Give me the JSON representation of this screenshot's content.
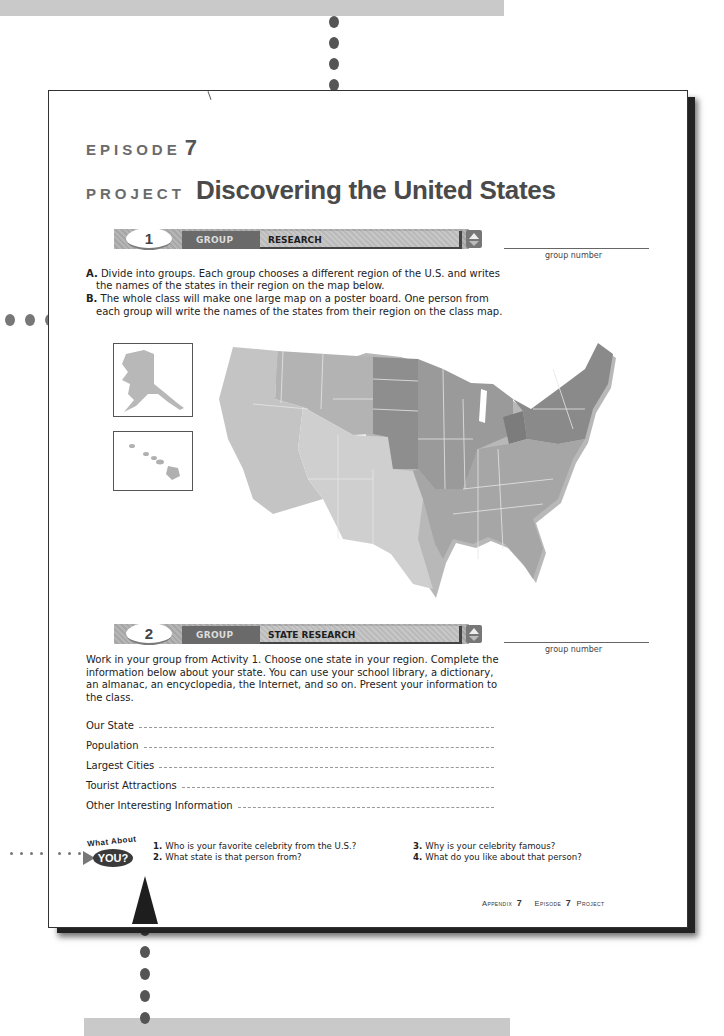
{
  "episode": {
    "label": "EPISODE",
    "number": "7"
  },
  "title": {
    "kicker": "PROJECT",
    "main": "Discovering the United States"
  },
  "sections": [
    {
      "number": "1",
      "group_tag": "GROUP",
      "title": "RESEARCH",
      "group_number_label": "group number",
      "instructions": [
        {
          "letter": "A.",
          "text": "Divide into groups. Each group chooses a different region of the U.S. and writes the names of the states in their region on the map below."
        },
        {
          "letter": "B.",
          "text": "The whole class will make one large map on a poster board. One person from each group will write the names of the states from their region on the class map."
        }
      ]
    },
    {
      "number": "2",
      "group_tag": "GROUP",
      "title": "STATE RESEARCH",
      "group_number_label": "group number",
      "paragraph": "Work in your group from Activity 1. Choose one state in your region. Complete the information below about your state. You can use your school library, a dictionary, an almanac, an encyclopedia, the Internet, and so on. Present your information to the class.",
      "fields": [
        {
          "label": "Our State",
          "value": ""
        },
        {
          "label": "Population",
          "value": ""
        },
        {
          "label": "Largest Cities",
          "value": ""
        },
        {
          "label": "Tourist Attractions",
          "value": ""
        },
        {
          "label": "Other Interesting Information",
          "value": ""
        }
      ]
    }
  ],
  "map": {
    "insets": [
      "Alaska",
      "Hawaii"
    ],
    "region_colors": {
      "west": "#c4c4c4",
      "northwest_mountain": "#b3b3b3",
      "midwest_plains": "#8e8e8e",
      "great_lakes": "#9c9c9c",
      "northeast": "#8a8a8a",
      "south": "#a6a6a6",
      "southwest": "#cfcfcf"
    }
  },
  "what_about_you": {
    "badge_top": "What About",
    "badge_bottom": "YOU?",
    "questions": [
      {
        "n": "1.",
        "text": "Who is your favorite celebrity from the U.S.?"
      },
      {
        "n": "2.",
        "text": "What state is that person from?"
      },
      {
        "n": "3.",
        "text": "Why is your celebrity famous?"
      },
      {
        "n": "4.",
        "text": "What do you like about that person?"
      }
    ]
  },
  "footer": {
    "appendix_label": "Appendix",
    "appendix_num": "7",
    "episode_label": "Episode",
    "episode_num": "7",
    "project_label": "Project"
  }
}
